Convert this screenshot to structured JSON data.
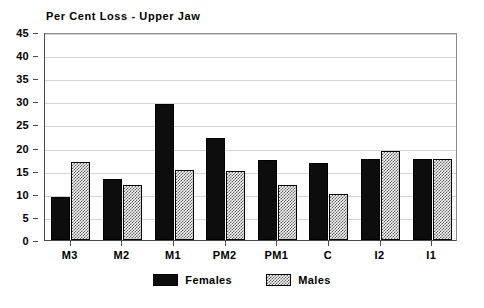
{
  "chart_data": {
    "type": "bar",
    "title": "Per Cent Loss - Upper Jaw",
    "xlabel": "",
    "ylabel": "",
    "categories": [
      "M3",
      "M2",
      "M1",
      "PM2",
      "PM1",
      "C",
      "I2",
      "I1"
    ],
    "series": [
      {
        "name": "Females",
        "color": "#000000",
        "pattern": "solid",
        "values": [
          9.2,
          13.2,
          29.5,
          22.0,
          17.3,
          16.7,
          17.5,
          17.5
        ]
      },
      {
        "name": "Males",
        "color": "#5a5a5a",
        "pattern": "checkerboard-hatch",
        "values": [
          16.9,
          11.8,
          15.1,
          14.9,
          11.9,
          10.0,
          19.3,
          17.6
        ]
      }
    ],
    "ylim": [
      0,
      45
    ],
    "yticks": [
      0,
      5,
      10,
      15,
      20,
      25,
      30,
      35,
      40,
      45
    ],
    "ytick_labels": [
      "0",
      "5",
      "10",
      "15",
      "20",
      "25",
      "30",
      "35",
      "40",
      "45"
    ],
    "grid": true,
    "grid_axis": "y",
    "legend_position": "bottom-center",
    "background_color": "#ffffff",
    "gridline_color": "#d3d3d3",
    "axis_color": "#4a4a4a"
  }
}
